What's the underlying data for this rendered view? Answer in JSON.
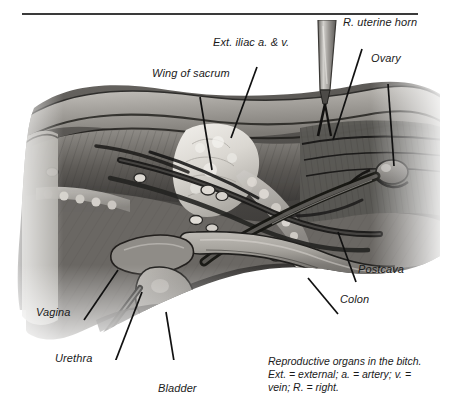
{
  "figure": {
    "title_rule": "horizontal-rule",
    "illustration_name": "canine-reproductive-anatomy-illustration",
    "style": "grayscale medical illustration, ventral abdominal dissection of a bitch",
    "colors": {
      "rule": "#3a3a3a",
      "label_text": "#1a1a1a",
      "leader_line": "#111111",
      "background": "#ffffff",
      "tissue_light": "#d8d6d2",
      "tissue_mid": "#9a9792",
      "tissue_dark": "#4a4845",
      "tissue_darkest": "#262523",
      "bone_highlight": "#eceae6",
      "instrument_steel": "#b9b7b2"
    }
  },
  "labels": [
    {
      "id": "ext-iliac",
      "text": "Ext. iliac a. & v.",
      "x": 213,
      "y": 36
    },
    {
      "id": "uterine-horn",
      "text": "R. uterine horn",
      "x": 343,
      "y": 16
    },
    {
      "id": "wing-sacrum",
      "text": "Wing of sacrum",
      "x": 152,
      "y": 67
    },
    {
      "id": "ovary",
      "text": "Ovary",
      "x": 371,
      "y": 52
    },
    {
      "id": "postcava",
      "text": "Postcava",
      "x": 358,
      "y": 263
    },
    {
      "id": "colon",
      "text": "Colon",
      "x": 340,
      "y": 293
    },
    {
      "id": "vagina",
      "text": "Vagina",
      "x": 36,
      "y": 306
    },
    {
      "id": "urethra",
      "text": "Urethra",
      "x": 55,
      "y": 352
    },
    {
      "id": "bladder",
      "text": "Bladder",
      "x": 158,
      "y": 382
    }
  ],
  "caption": {
    "line1": "Reproductive organs in the bitch.",
    "line2": "Ext. = external; a. = artery; v. =",
    "line3": "vein; R. = right."
  }
}
